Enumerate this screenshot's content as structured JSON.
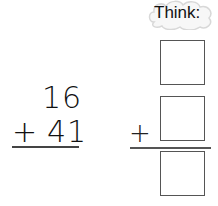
{
  "think_bubble": {
    "label": "Think:"
  },
  "problem": {
    "addend_top": "16",
    "operator": "+",
    "addend_bottom": "41"
  },
  "think_work": {
    "operator": "+",
    "boxes": [
      "",
      "",
      ""
    ]
  }
}
